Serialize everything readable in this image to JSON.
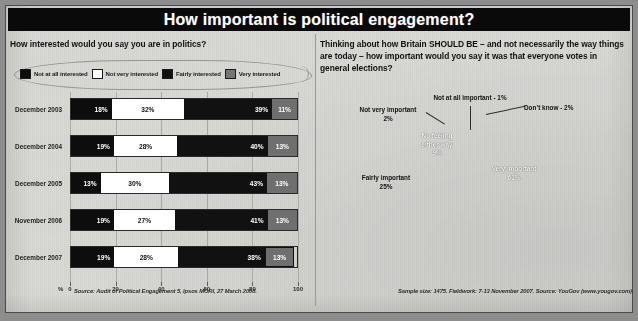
{
  "header": {
    "title": "How important is political engagement?"
  },
  "left": {
    "question": "How interested would you say you are in politics?",
    "legend": [
      {
        "label": "Not at all interested",
        "color": "#0d0d0d"
      },
      {
        "label": "Not very interested",
        "color": "#ffffff"
      },
      {
        "label": "Fairly interested",
        "color": "#111111"
      },
      {
        "label": "Very interested",
        "color": "#767676"
      }
    ],
    "axis_unit": "%",
    "source": "Source: Audit of Political Engagement 5, Ipsos MORI, 27 March 2008."
  },
  "right": {
    "question": "Thinking about how Britain SHOULD BE – and not necessarily the way things are today – how important would you say it was that everyone votes in general elections?",
    "source": "Sample size: 1475. Fieldwork: 7-13 November 2007. Source: YouGov (www.yougov.com)."
  },
  "chart_data": [
    {
      "type": "bar",
      "orientation": "horizontal",
      "stacked": true,
      "percent": true,
      "title": "How interested would you say you are in politics?",
      "xlabel": "%",
      "ylabel": "",
      "xlim": [
        0,
        100
      ],
      "xticks": [
        0,
        20,
        40,
        60,
        80,
        100
      ],
      "grid": true,
      "legend_position": "top",
      "categories": [
        "December 2003",
        "December 2004",
        "December 2005",
        "November 2006",
        "December 2007"
      ],
      "series": [
        {
          "name": "Not at all interested",
          "color": "#0d0d0d",
          "values": [
            18,
            19,
            13,
            19,
            19
          ]
        },
        {
          "name": "Not very interested",
          "color": "#ffffff",
          "values": [
            32,
            28,
            30,
            27,
            28
          ]
        },
        {
          "name": "Fairly interested",
          "color": "#111111",
          "values": [
            39,
            40,
            43,
            41,
            38
          ]
        },
        {
          "name": "Very interested",
          "color": "#6f6f6f",
          "values": [
            11,
            13,
            13,
            13,
            13
          ]
        }
      ],
      "highlight_category": "December 2007",
      "highlight_series": "Very interested",
      "labels": [
        [
          "18%",
          "32%",
          "39%",
          "11%"
        ],
        [
          "19%",
          "28%",
          "40%",
          "13%"
        ],
        [
          "13%",
          "30%",
          "43%",
          "13%"
        ],
        [
          "19%",
          "27%",
          "41%",
          "13%"
        ],
        [
          "19%",
          "28%",
          "38%",
          "13%"
        ]
      ],
      "source": "Source: Audit of Political Engagement 5, Ipsos MORI, 27 March 2008."
    },
    {
      "type": "pie",
      "three_d": true,
      "title": "Thinking about how Britain SHOULD BE – and not necessarily the way things are today – how important would you say it was that everyone votes in general elections?",
      "percent": true,
      "slices": [
        {
          "label": "Very important",
          "value": 61,
          "display": "61%",
          "color": "#0b0b0b",
          "label_text": "Very important",
          "label_value": "61%"
        },
        {
          "label": "Fairly important",
          "value": 25,
          "display": "25%",
          "color": "#fbfbfb",
          "label_text": "Fairly important",
          "label_value": "25%"
        },
        {
          "label": "No feeling either way",
          "value": 9,
          "display": "9%",
          "color": "#a8a8a5",
          "label_text": "No feeling\neither way",
          "label_value": "9%"
        },
        {
          "label": "Not very important",
          "value": 2,
          "display": "2%",
          "color": "#111111",
          "label_text": "Not very important",
          "label_value": "2%"
        },
        {
          "label": "Not at all important",
          "value": 1,
          "display": "1%",
          "color": "#0d0d0d",
          "label_text": "Not at all important - 1%",
          "label_value": "1%"
        },
        {
          "label": "Don't know",
          "value": 2,
          "display": "2%",
          "color": "#8d8d8a",
          "label_text": "Don’t know - 2%",
          "label_value": "2%"
        }
      ],
      "annotations": {
        "not_at_all": "Not at all important - 1%",
        "dont_know": "Don’t know - 2%",
        "not_very_l1": "Not very important",
        "not_very_l2": "2%",
        "no_feeling_l1": "No feeling",
        "no_feeling_l2": "either way",
        "no_feeling_l3": "9%",
        "fairly_l1": "Fairly important",
        "fairly_l2": "25%",
        "very_l1": "Very important",
        "very_l2": "61%"
      },
      "source": "Sample size: 1475. Fieldwork: 7-13 November 2007. Source: YouGov (www.yougov.com)."
    }
  ]
}
